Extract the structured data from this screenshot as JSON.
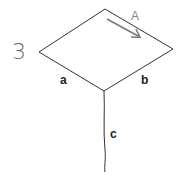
{
  "figure_number": "3",
  "labels": {
    "arrow": "A",
    "edge_left": "a",
    "edge_right": "b",
    "edge_stem": "c"
  },
  "colors": {
    "line": "#333333",
    "arrow": "#7a7a7a",
    "number": "#6a6a6a"
  }
}
